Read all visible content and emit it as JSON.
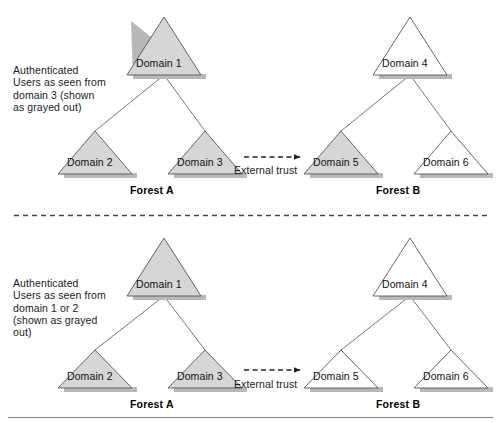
{
  "diagram": {
    "title_top_note": "Authenticated\nUsers as seen from\ndomain 3 (shown\nas grayed out)",
    "title_bottom_note": "Authenticated\nUsers as seen from\ndomain 1 or 2\n(shown as grayed\nout)",
    "colors": {
      "grayed_fill": "#d6d6d6",
      "plain_fill": "#ffffff",
      "outline": "#555555",
      "shadow": "#b5b5b5",
      "connector": "#666666",
      "text": "#111111",
      "rule": "#808080"
    },
    "panels": [
      {
        "id": "top",
        "note": "Authenticated\nUsers as seen from\ndomain 3 (shown\nas grayed out)",
        "forest_a_label": "Forest A",
        "forest_b_label": "Forest B",
        "trust_label": "External trust",
        "domains": [
          {
            "label": "Domain 1",
            "grayed": true,
            "forest": "A",
            "level": "root"
          },
          {
            "label": "Domain 2",
            "grayed": true,
            "forest": "A",
            "level": "child"
          },
          {
            "label": "Domain 3",
            "grayed": true,
            "forest": "A",
            "level": "child"
          },
          {
            "label": "Domain 4",
            "grayed": false,
            "forest": "B",
            "level": "root"
          },
          {
            "label": "Domain 5",
            "grayed": true,
            "forest": "B",
            "level": "child"
          },
          {
            "label": "Domain 6",
            "grayed": false,
            "forest": "B",
            "level": "child"
          }
        ]
      },
      {
        "id": "bottom",
        "note": "Authenticated\nUsers as seen from\ndomain 1 or 2\n(shown as grayed\nout)",
        "forest_a_label": "Forest A",
        "forest_b_label": "Forest B",
        "trust_label": "External trust",
        "domains": [
          {
            "label": "Domain 1",
            "grayed": true,
            "forest": "A",
            "level": "root"
          },
          {
            "label": "Domain 2",
            "grayed": true,
            "forest": "A",
            "level": "child"
          },
          {
            "label": "Domain 3",
            "grayed": true,
            "forest": "A",
            "level": "child"
          },
          {
            "label": "Domain 4",
            "grayed": false,
            "forest": "B",
            "level": "root"
          },
          {
            "label": "Domain 5",
            "grayed": false,
            "forest": "B",
            "level": "child"
          },
          {
            "label": "Domain 6",
            "grayed": false,
            "forest": "B",
            "level": "child"
          }
        ]
      }
    ],
    "separator": "dashed-horizontal-divider",
    "footer_rule": "solid-horizontal-rule"
  }
}
